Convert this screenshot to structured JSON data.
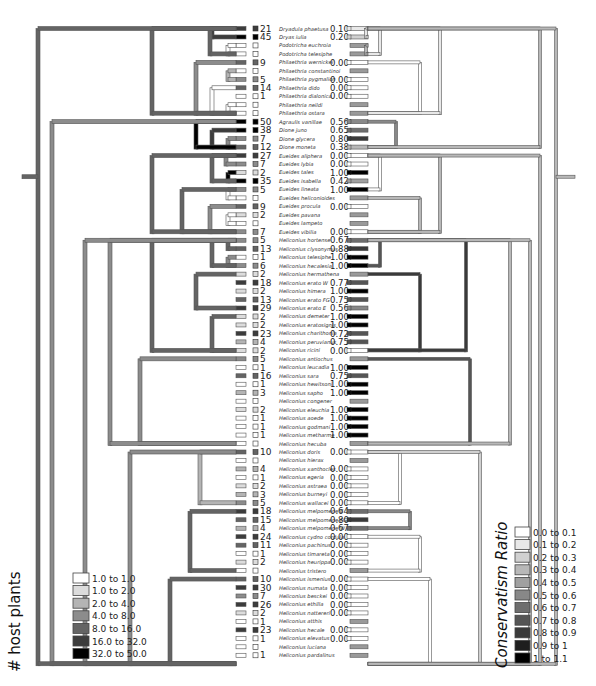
{
  "chart_data": {
    "type": "tanglegram-phylogeny",
    "title": "",
    "left_tree": {
      "encoding": "branch color = # host plants"
    },
    "right_tree": {
      "encoding": "branch color = Conservatism Ratio"
    },
    "taxa": [
      {
        "name": "Dryadula phaetusa",
        "hosts": "21",
        "ratio": "0.10"
      },
      {
        "name": "Dryas iulia",
        "hosts": "45",
        "ratio": "0.20"
      },
      {
        "name": "Podotricha euchroia",
        "hosts": "",
        "ratio": ""
      },
      {
        "name": "Podotricha telesiphe",
        "hosts": "",
        "ratio": ""
      },
      {
        "name": "Philaethria wernickei",
        "hosts": "9",
        "ratio": "0.00"
      },
      {
        "name": "Philaethria constantinoi",
        "hosts": "",
        "ratio": ""
      },
      {
        "name": "Philaethria pygmalion",
        "hosts": "5",
        "ratio": "0.00"
      },
      {
        "name": "Philaethria dido",
        "hosts": "14",
        "ratio": "0.00"
      },
      {
        "name": "Philaethria dialonica",
        "hosts": "1",
        "ratio": "0.00"
      },
      {
        "name": "Philaethria neildi",
        "hosts": "",
        "ratio": ""
      },
      {
        "name": "Philaethria ostara",
        "hosts": "",
        "ratio": ""
      },
      {
        "name": "Agraulis vanillae",
        "hosts": "50",
        "ratio": "0.56"
      },
      {
        "name": "Dione juno",
        "hosts": "38",
        "ratio": "0.65"
      },
      {
        "name": "Dione glycera",
        "hosts": "7",
        "ratio": "0.80"
      },
      {
        "name": "Dione moneta",
        "hosts": "12",
        "ratio": "0.38"
      },
      {
        "name": "Eueides aliphera",
        "hosts": "27",
        "ratio": "0.00"
      },
      {
        "name": "Eueides lybia",
        "hosts": "7",
        "ratio": "0.00"
      },
      {
        "name": "Eueides tales",
        "hosts": "2",
        "ratio": "1.00"
      },
      {
        "name": "Eueides isabella",
        "hosts": "35",
        "ratio": "0.42"
      },
      {
        "name": "Eueides lineata",
        "hosts": "5",
        "ratio": "1.00"
      },
      {
        "name": "Eueides heliconioides",
        "hosts": "",
        "ratio": ""
      },
      {
        "name": "Eueides procula",
        "hosts": "9",
        "ratio": "0.00"
      },
      {
        "name": "Eueides pavana",
        "hosts": "2",
        "ratio": ""
      },
      {
        "name": "Eueides lampeto",
        "hosts": "",
        "ratio": ""
      },
      {
        "name": "Eueides vibilia",
        "hosts": "7",
        "ratio": "0.00"
      },
      {
        "name": "Heliconius hortense",
        "hosts": "5",
        "ratio": "0.67"
      },
      {
        "name": "Heliconius clysonymus",
        "hosts": "13",
        "ratio": "0.88"
      },
      {
        "name": "Heliconius telesiphe",
        "hosts": "1",
        "ratio": "1.00"
      },
      {
        "name": "Heliconius hecalesia",
        "hosts": "6",
        "ratio": "1.00"
      },
      {
        "name": "Heliconius hermathena",
        "hosts": "2",
        "ratio": ""
      },
      {
        "name": "Heliconius erato W",
        "hosts": "18",
        "ratio": "0.77"
      },
      {
        "name": "Heliconius himera",
        "hosts": "2",
        "ratio": "1.00"
      },
      {
        "name": "Heliconius erato FG",
        "hosts": "13",
        "ratio": "0.75"
      },
      {
        "name": "Heliconius erato E",
        "hosts": "29",
        "ratio": "0.56"
      },
      {
        "name": "Heliconius demeter",
        "hosts": "2",
        "ratio": "1.00"
      },
      {
        "name": "Heliconius eratosignis",
        "hosts": "2",
        "ratio": "1.00"
      },
      {
        "name": "Heliconius charithonia",
        "hosts": "23",
        "ratio": "0.72"
      },
      {
        "name": "Heliconius peruvianus",
        "hosts": "4",
        "ratio": "0.75"
      },
      {
        "name": "Heliconius ricini",
        "hosts": "2",
        "ratio": "0.00"
      },
      {
        "name": "Heliconius antiochus",
        "hosts": "5",
        "ratio": ""
      },
      {
        "name": "Heliconius leucadia",
        "hosts": "1",
        "ratio": "1.00"
      },
      {
        "name": "Heliconius sara",
        "hosts": "16",
        "ratio": "0.75"
      },
      {
        "name": "Heliconius hewitsoni",
        "hosts": "1",
        "ratio": "1.00"
      },
      {
        "name": "Heliconius sapho",
        "hosts": "3",
        "ratio": "1.00"
      },
      {
        "name": "Heliconius congener",
        "hosts": "",
        "ratio": ""
      },
      {
        "name": "Heliconius eleuchia",
        "hosts": "2",
        "ratio": "1.00"
      },
      {
        "name": "Heliconius aoede",
        "hosts": "1",
        "ratio": "1.00"
      },
      {
        "name": "Heliconius godmani",
        "hosts": "1",
        "ratio": "1.00"
      },
      {
        "name": "Heliconius metharme",
        "hosts": "1",
        "ratio": "1.00"
      },
      {
        "name": "Heliconius hecuba",
        "hosts": "",
        "ratio": ""
      },
      {
        "name": "Heliconius doris",
        "hosts": "10",
        "ratio": "0.00"
      },
      {
        "name": "Heliconius hierax",
        "hosts": "",
        "ratio": ""
      },
      {
        "name": "Heliconius xanthocles",
        "hosts": "4",
        "ratio": "0.00"
      },
      {
        "name": "Heliconius egeria",
        "hosts": "1",
        "ratio": "0.00"
      },
      {
        "name": "Heliconius astraea",
        "hosts": "2",
        "ratio": "0.00"
      },
      {
        "name": "Heliconius burneyi",
        "hosts": "3",
        "ratio": "0.00"
      },
      {
        "name": "Heliconius wallacei",
        "hosts": "5",
        "ratio": "0.00"
      },
      {
        "name": "Heliconius melpomene E",
        "hosts": "18",
        "ratio": "0.64"
      },
      {
        "name": "Heliconius melpomene FG",
        "hosts": "15",
        "ratio": "0.80"
      },
      {
        "name": "Heliconius melpomene W",
        "hosts": "4",
        "ratio": "0.67"
      },
      {
        "name": "Heliconius cydno cordula",
        "hosts": "24",
        "ratio": "0.00"
      },
      {
        "name": "Heliconius pachinus",
        "hosts": "11",
        "ratio": "0.00"
      },
      {
        "name": "Heliconius timareta",
        "hosts": "1",
        "ratio": "0.00"
      },
      {
        "name": "Heliconius heurippa",
        "hosts": "2",
        "ratio": "0.00"
      },
      {
        "name": "Heliconius tristero",
        "hosts": "",
        "ratio": ""
      },
      {
        "name": "Heliconius ismenius",
        "hosts": "10",
        "ratio": "0.00"
      },
      {
        "name": "Heliconius numata",
        "hosts": "30",
        "ratio": "0.00"
      },
      {
        "name": "Heliconius besckei",
        "hosts": "7",
        "ratio": "0.00"
      },
      {
        "name": "Heliconius ethilla",
        "hosts": "26",
        "ratio": "0.00"
      },
      {
        "name": "Heliconius nattereri",
        "hosts": "2",
        "ratio": "0.00"
      },
      {
        "name": "Heliconius atthis",
        "hosts": "1",
        "ratio": ""
      },
      {
        "name": "Heliconius hecale",
        "hosts": "23",
        "ratio": "0.00"
      },
      {
        "name": "Heliconius elevatus",
        "hosts": "1",
        "ratio": "0.00"
      },
      {
        "name": "Heliconius luciana",
        "hosts": "",
        "ratio": ""
      },
      {
        "name": "Heliconius pardalinus",
        "hosts": "1",
        "ratio": ""
      }
    ],
    "legends": {
      "host_plants": {
        "title": "# host plants",
        "items": [
          {
            "label": "1.0 to 1.0",
            "color": "#ffffff"
          },
          {
            "label": "1.0 to 2.0",
            "color": "#dcdcdc"
          },
          {
            "label": "2.0 to 4.0",
            "color": "#b4b4b4"
          },
          {
            "label": "4.0 to 8.0",
            "color": "#8c8c8c"
          },
          {
            "label": "8.0 to 16.0",
            "color": "#646464"
          },
          {
            "label": "16.0 to 32.0",
            "color": "#3c3c3c"
          },
          {
            "label": "32.0 to 50.0",
            "color": "#000000"
          }
        ]
      },
      "conservatism": {
        "title": "Conservatism Ratio",
        "items": [
          {
            "label": "0.0 to 0.1",
            "color": "#ffffff"
          },
          {
            "label": "0.1 to 0.2",
            "color": "#e8e8e8"
          },
          {
            "label": "0.2 to 0.3",
            "color": "#d0d0d0"
          },
          {
            "label": "0.3 to 0.4",
            "color": "#b8b8b8"
          },
          {
            "label": "0.4 to 0.5",
            "color": "#a0a0a0"
          },
          {
            "label": "0.5 to 0.6",
            "color": "#888888"
          },
          {
            "label": "0.6 to 0.7",
            "color": "#6e6e6e"
          },
          {
            "label": "0.7 to 0.8",
            "color": "#555555"
          },
          {
            "label": "0.8 to 0.9",
            "color": "#3a3a3a"
          },
          {
            "label": "0.9 to 1",
            "color": "#1e1e1e"
          },
          {
            "label": "1 to 1.1",
            "color": "#000000"
          }
        ]
      }
    }
  }
}
